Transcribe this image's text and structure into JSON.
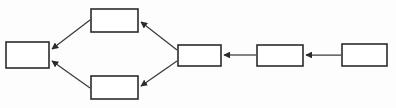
{
  "diagram": {
    "title": "",
    "type": "flowchart",
    "orientation": "right-to-left",
    "canvas": {
      "width": 396,
      "height": 108
    },
    "style": {
      "background_color": "#fdfdfd",
      "node_fill": "#ffffff",
      "node_stroke": "#2b2b2b",
      "edge_color": "#3a3a3a",
      "arrow_color": "#2b2b2b"
    },
    "nodes": [
      {
        "id": "node-left",
        "label": "",
        "x": 6,
        "y": 42,
        "width": 43,
        "height": 26,
        "role": "sink"
      },
      {
        "id": "node-top-branch",
        "label": "",
        "x": 91,
        "y": 9,
        "width": 47,
        "height": 23,
        "role": "branch-upper"
      },
      {
        "id": "node-bottom-branch",
        "label": "",
        "x": 91,
        "y": 76,
        "width": 47,
        "height": 23,
        "role": "branch-lower"
      },
      {
        "id": "node-junction",
        "label": "",
        "x": 178,
        "y": 45,
        "width": 43,
        "height": 21,
        "role": "split"
      },
      {
        "id": "node-middle",
        "label": "",
        "x": 257,
        "y": 45,
        "width": 46,
        "height": 21,
        "role": "stage"
      },
      {
        "id": "node-right",
        "label": "",
        "x": 342,
        "y": 44,
        "width": 45,
        "height": 22,
        "role": "source"
      }
    ],
    "edges": [
      {
        "id": "edge-top-to-left",
        "from": "node-top-branch",
        "to": "node-left",
        "kind": "diagonal",
        "direction": "down-left",
        "x1": 90,
        "y1": 20,
        "x2": 50,
        "y2": 50,
        "arrow_at": "target"
      },
      {
        "id": "edge-bottom-to-left",
        "from": "node-bottom-branch",
        "to": "node-left",
        "kind": "diagonal",
        "direction": "up-left",
        "x1": 90,
        "y1": 88,
        "x2": 50,
        "y2": 60,
        "arrow_at": "target"
      },
      {
        "id": "edge-junction-to-top",
        "from": "node-junction",
        "to": "node-top-branch",
        "kind": "diagonal",
        "direction": "up-left",
        "x1": 177,
        "y1": 50,
        "x2": 139,
        "y2": 21,
        "arrow_at": "target"
      },
      {
        "id": "edge-junction-to-bottom",
        "from": "node-junction",
        "to": "node-bottom-branch",
        "kind": "diagonal",
        "direction": "down-left",
        "x1": 177,
        "y1": 61,
        "x2": 139,
        "y2": 87,
        "arrow_at": "target"
      },
      {
        "id": "edge-middle-to-junction",
        "from": "node-middle",
        "to": "node-junction",
        "kind": "horizontal",
        "direction": "left",
        "x1": 256,
        "y1": 55,
        "x2": 222,
        "y2": 55,
        "arrow_at": "target"
      },
      {
        "id": "edge-right-to-middle",
        "from": "node-right",
        "to": "node-middle",
        "kind": "horizontal",
        "direction": "left",
        "x1": 341,
        "y1": 55,
        "x2": 304,
        "y2": 55,
        "arrow_at": "target"
      }
    ]
  }
}
